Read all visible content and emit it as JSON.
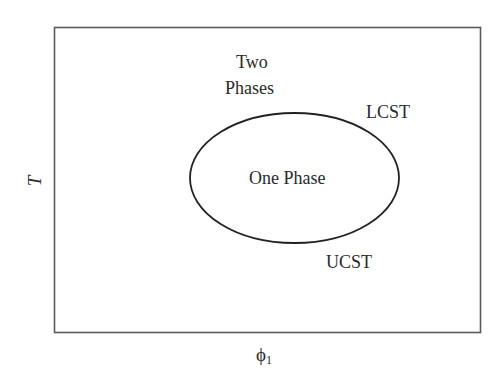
{
  "diagram": {
    "type": "phase-diagram",
    "x_axis_label": "ϕ",
    "x_axis_subscript": "1",
    "y_axis_label": "T",
    "regions": {
      "outside": {
        "line1": "Two",
        "line2": "Phases"
      },
      "inside": "One Phase"
    },
    "annotations": {
      "upper": "LCST",
      "lower": "UCST"
    },
    "colors": {
      "frame": "#555555",
      "curve": "#222222",
      "text": "#2a2a2a",
      "background": "#ffffff"
    }
  }
}
